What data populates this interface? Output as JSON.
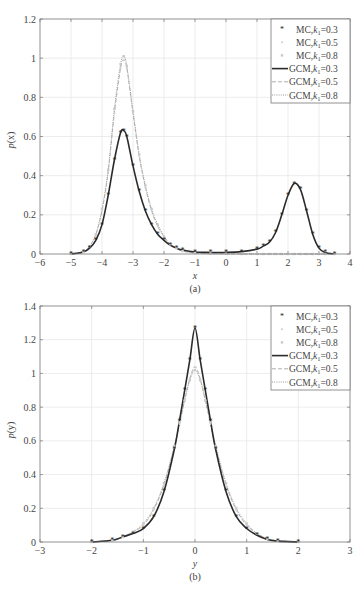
{
  "chart_data": [
    {
      "type": "line",
      "panel": "(a)",
      "title": "",
      "xlabel": "x",
      "ylabel": "p(x)",
      "caption": "(a)",
      "xlim": [
        -6,
        4
      ],
      "ylim": [
        0,
        1.2
      ],
      "xticks": [
        "−6",
        "−5",
        "−4",
        "−3",
        "−2",
        "−1",
        "0",
        "1",
        "2",
        "3",
        "4"
      ],
      "yticks": [
        "0",
        "0.2",
        "0.4",
        "0.6",
        "0.8",
        "1",
        "1.2"
      ],
      "grid": true,
      "legend_position": "upper right",
      "legend": [
        "MC,k1=0.3",
        "MC,k1=0.5",
        "MC,k1=0.8",
        "GCM,k1=0.3",
        "GCM,k1=0.5",
        "GCM,k1=0.8"
      ],
      "x": [
        -5.0,
        -4.6,
        -4.4,
        -4.2,
        -4.0,
        -3.8,
        -3.6,
        -3.4,
        -3.3,
        -3.2,
        -3.0,
        -2.8,
        -2.6,
        -2.4,
        -2.2,
        -2.0,
        -1.8,
        -1.6,
        -1.4,
        -1.0,
        -0.5,
        0.0,
        0.5,
        1.0,
        1.2,
        1.4,
        1.6,
        1.8,
        2.0,
        2.2,
        2.4,
        2.6,
        2.8,
        3.0,
        3.2,
        3.5
      ],
      "series": [
        {
          "name": "GCM,k1=0.3",
          "style": "solid",
          "values": [
            0.0,
            0.01,
            0.03,
            0.07,
            0.15,
            0.3,
            0.48,
            0.62,
            0.63,
            0.6,
            0.45,
            0.32,
            0.22,
            0.15,
            0.1,
            0.07,
            0.045,
            0.03,
            0.02,
            0.01,
            0.008,
            0.008,
            0.012,
            0.025,
            0.04,
            0.06,
            0.11,
            0.2,
            0.3,
            0.36,
            0.33,
            0.22,
            0.1,
            0.03,
            0.008,
            0.0
          ]
        },
        {
          "name": "GCM,k1=0.5",
          "style": "dashed",
          "values": [
            0.0,
            0.01,
            0.04,
            0.1,
            0.22,
            0.42,
            0.72,
            0.95,
            0.99,
            0.95,
            0.72,
            0.5,
            0.34,
            0.22,
            0.14,
            0.09,
            0.05,
            0.03,
            0.015,
            0.005,
            0.002,
            0.001,
            0.0,
            0.0,
            0.0,
            0.0,
            0.0,
            0.0,
            0.0,
            0.0,
            0.0,
            0.0,
            0.0,
            0.0,
            0.0,
            0.0
          ]
        },
        {
          "name": "GCM,k1=0.8",
          "style": "dotted",
          "values": [
            0.0,
            0.01,
            0.04,
            0.1,
            0.23,
            0.43,
            0.74,
            0.97,
            1.01,
            0.96,
            0.73,
            0.51,
            0.35,
            0.23,
            0.15,
            0.09,
            0.05,
            0.03,
            0.015,
            0.005,
            0.002,
            0.001,
            0.0,
            0.0,
            0.0,
            0.0,
            0.0,
            0.0,
            0.0,
            0.0,
            0.0,
            0.0,
            0.0,
            0.0,
            0.0,
            0.0
          ]
        }
      ]
    },
    {
      "type": "line",
      "panel": "(b)",
      "title": "",
      "xlabel": "y",
      "ylabel": "p(y)",
      "caption": "(b)",
      "xlim": [
        -3,
        3
      ],
      "ylim": [
        0,
        1.4
      ],
      "xticks": [
        "−3",
        "−2",
        "−1",
        "0",
        "1",
        "2",
        "3"
      ],
      "yticks": [
        "0",
        "0.2",
        "0.4",
        "0.6",
        "0.8",
        "1",
        "1.2",
        "1.4"
      ],
      "grid": true,
      "legend_position": "upper right",
      "legend": [
        "MC,k1=0.3",
        "MC,k1=0.5",
        "MC,k1=0.8",
        "GCM,k1=0.3",
        "GCM,k1=0.5",
        "GCM,k1=0.8"
      ],
      "x": [
        -2.0,
        -1.6,
        -1.4,
        -1.2,
        -1.0,
        -0.8,
        -0.6,
        -0.4,
        -0.3,
        -0.2,
        -0.1,
        0.0,
        0.1,
        0.2,
        0.3,
        0.4,
        0.6,
        0.8,
        1.0,
        1.2,
        1.4,
        1.6,
        2.0
      ],
      "series": [
        {
          "name": "GCM,k1=0.3",
          "style": "solid",
          "values": [
            0.0,
            0.01,
            0.03,
            0.05,
            0.08,
            0.15,
            0.3,
            0.55,
            0.72,
            0.9,
            1.08,
            1.27,
            1.08,
            0.9,
            0.72,
            0.55,
            0.3,
            0.15,
            0.08,
            0.04,
            0.015,
            0.005,
            0.0
          ]
        },
        {
          "name": "GCM,k1=0.5",
          "style": "dashed",
          "values": [
            0.0,
            0.01,
            0.03,
            0.06,
            0.1,
            0.19,
            0.34,
            0.56,
            0.7,
            0.84,
            0.97,
            1.04,
            0.97,
            0.84,
            0.7,
            0.56,
            0.34,
            0.19,
            0.1,
            0.05,
            0.02,
            0.008,
            0.0
          ]
        },
        {
          "name": "GCM,k1=0.8",
          "style": "dotted",
          "values": [
            0.0,
            0.01,
            0.03,
            0.06,
            0.11,
            0.2,
            0.35,
            0.57,
            0.71,
            0.84,
            0.96,
            1.02,
            0.96,
            0.84,
            0.71,
            0.57,
            0.35,
            0.2,
            0.11,
            0.05,
            0.02,
            0.008,
            0.0
          ]
        }
      ]
    }
  ],
  "figure": {
    "top": {
      "ylabel_main": "p",
      "ylabel_arg": "(x)",
      "xlabel": "x",
      "caption": "(a)",
      "legend": [
        {
          "prefix": "MC,",
          "k": "k",
          "sub": "1",
          "val": "=0.3"
        },
        {
          "prefix": "MC,",
          "k": "k",
          "sub": "1",
          "val": "=0.5"
        },
        {
          "prefix": "MC,",
          "k": "k",
          "sub": "1",
          "val": "=0.8"
        },
        {
          "prefix": "GCM,",
          "k": "k",
          "sub": "1",
          "val": "=0.3"
        },
        {
          "prefix": "GCM,",
          "k": "k",
          "sub": "1",
          "val": "=0.5"
        },
        {
          "prefix": "GCM,",
          "k": "k",
          "sub": "1",
          "val": "=0.8"
        }
      ]
    },
    "bottom": {
      "ylabel_main": "p",
      "ylabel_arg": "(y)",
      "xlabel": "y",
      "caption": "(b)",
      "legend": [
        {
          "prefix": "MC,",
          "k": "k",
          "sub": "1",
          "val": "=0.3"
        },
        {
          "prefix": "MC,",
          "k": "k",
          "sub": "1",
          "val": "=0.5"
        },
        {
          "prefix": "MC,",
          "k": "k",
          "sub": "1",
          "val": "=0.8"
        },
        {
          "prefix": "GCM,",
          "k": "k",
          "sub": "1",
          "val": "=0.3"
        },
        {
          "prefix": "GCM,",
          "k": "k",
          "sub": "1",
          "val": "=0.5"
        },
        {
          "prefix": "GCM,",
          "k": "k",
          "sub": "1",
          "val": "=0.8"
        }
      ]
    }
  },
  "colors": {
    "k03": "#2b2b2b",
    "k05": "#b0b0b0",
    "k08": "#9a9a9a",
    "grid": "#e4e4e4",
    "axis": "#666666"
  }
}
